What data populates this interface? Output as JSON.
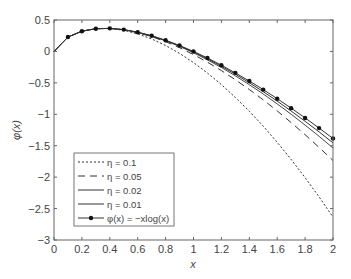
{
  "chart_data": {
    "type": "line",
    "title": "",
    "xlabel": "x",
    "ylabel": "φ(x)",
    "xlim": [
      0,
      2
    ],
    "ylim": [
      -3,
      0.5
    ],
    "grid": false,
    "legend_position": "lower left (inside)",
    "xticks": [
      0,
      0.2,
      0.4,
      0.6,
      0.8,
      1,
      1.2,
      1.4,
      1.6,
      1.8,
      2
    ],
    "xtick_labels": [
      "0",
      "0.2",
      "0.4",
      "0.6",
      "0.8",
      "1",
      "1.2",
      "1.4",
      "1.6",
      "1.8",
      "2"
    ],
    "yticks": [
      0.5,
      0,
      -0.5,
      -1,
      -1.5,
      -2,
      -2.5,
      -3
    ],
    "ytick_labels": [
      "0.5",
      "0",
      "−0.5",
      "−1",
      "−1.5",
      "−2",
      "−2.5",
      "−3"
    ],
    "x": [
      0,
      0.1,
      0.2,
      0.3,
      0.4,
      0.5,
      0.6,
      0.7,
      0.8,
      0.9,
      1.0,
      1.1,
      1.2,
      1.3,
      1.4,
      1.5,
      1.6,
      1.7,
      1.8,
      1.9,
      2.0
    ],
    "series": [
      {
        "name": "η = 0.1",
        "style": "dotted",
        "values": [
          0,
          0.23,
          0.322,
          0.361,
          0.365,
          0.336,
          0.279,
          0.199,
          0.094,
          -0.031,
          -0.178,
          -0.344,
          -0.528,
          -0.731,
          -0.951,
          -1.189,
          -1.446,
          -1.718,
          -2.008,
          -2.315,
          -2.636
        ]
      },
      {
        "name": "η = 0.05",
        "style": "dashed",
        "values": [
          0,
          0.23,
          0.322,
          0.361,
          0.366,
          0.344,
          0.298,
          0.236,
          0.155,
          0.06,
          -0.05,
          -0.172,
          -0.305,
          -0.45,
          -0.605,
          -0.771,
          -0.946,
          -1.131,
          -1.324,
          -1.527,
          -1.736
        ]
      },
      {
        "name": "η = 0.02",
        "style": "solid-thin",
        "values": [
          0,
          0.23,
          0.322,
          0.361,
          0.367,
          0.346,
          0.303,
          0.244,
          0.169,
          0.08,
          -0.021,
          -0.134,
          -0.256,
          -0.388,
          -0.529,
          -0.678,
          -0.835,
          -0.999,
          -1.172,
          -1.351,
          -1.536
        ]
      },
      {
        "name": "η = 0.01",
        "style": "solid",
        "values": [
          0,
          0.23,
          0.322,
          0.361,
          0.367,
          0.346,
          0.304,
          0.247,
          0.174,
          0.088,
          -0.01,
          -0.118,
          -0.236,
          -0.363,
          -0.498,
          -0.641,
          -0.791,
          -0.948,
          -1.111,
          -1.281,
          -1.456
        ]
      },
      {
        "name": "φ(x) = −xlog(x)",
        "style": "solid-with-markers",
        "values": [
          0,
          0.23,
          0.322,
          0.361,
          0.367,
          0.347,
          0.306,
          0.25,
          0.179,
          0.095,
          0,
          -0.105,
          -0.219,
          -0.341,
          -0.471,
          -0.608,
          -0.752,
          -0.902,
          -1.058,
          -1.22,
          -1.386
        ]
      }
    ]
  },
  "legend": {
    "items": [
      {
        "label": "η = 0.1",
        "dash": "2,2"
      },
      {
        "label": "η = 0.05",
        "dash": "7,5"
      },
      {
        "label": "η = 0.02",
        "dash": ""
      },
      {
        "label": "η = 0.01",
        "dash": ""
      },
      {
        "label": "φ(x) = −xlog(x)",
        "dash": "",
        "marker": true
      }
    ]
  },
  "axes": {
    "xlabel": "x",
    "ylabel": "φ(x)"
  },
  "colors": {
    "line": "#333333",
    "axis": "#666666",
    "legend_border": "#777777"
  }
}
